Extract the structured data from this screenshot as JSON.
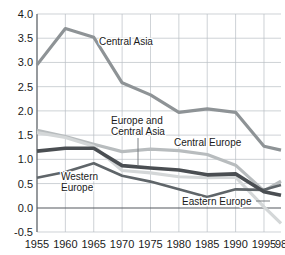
{
  "chart_data": {
    "type": "line",
    "title": "",
    "xlabel": "",
    "ylabel": "",
    "xlim": [
      1955,
      1998
    ],
    "ylim": [
      -0.5,
      4.0
    ],
    "grid": true,
    "legend_position": "inline-annotations",
    "x": [
      1955,
      1960,
      1965,
      1970,
      1975,
      1980,
      1985,
      1990,
      1995,
      1998
    ],
    "xtick_labels": [
      "1955",
      "1960",
      "1965",
      "1970",
      "1975",
      "1980",
      "1985",
      "1990",
      "1995",
      "98"
    ],
    "ytick_labels": [
      "4.0",
      "3.5",
      "3.0",
      "2.5",
      "2.0",
      "1.5",
      "1.0",
      "0.5",
      "0.0",
      "-0.5"
    ],
    "ytick_values": [
      4.0,
      3.5,
      3.0,
      2.5,
      2.0,
      1.5,
      1.0,
      0.5,
      0.0,
      -0.5
    ],
    "series": [
      {
        "name": "Central Asia",
        "color": "#8e9396",
        "width": 3.2,
        "values": [
          2.95,
          3.7,
          3.52,
          2.58,
          2.33,
          1.97,
          2.04,
          1.97,
          1.27,
          1.19
        ]
      },
      {
        "name": "Central Europe",
        "color": "#b8bcbe",
        "width": 3.2,
        "values": [
          1.6,
          1.47,
          1.31,
          1.16,
          1.21,
          1.18,
          1.1,
          0.88,
          0.35,
          0.55
        ]
      },
      {
        "name": "Europe and Central Asia",
        "color": "#d4d7d8",
        "width": 3.2,
        "values": [
          1.55,
          1.45,
          1.27,
          0.77,
          0.72,
          0.64,
          0.62,
          0.63,
          0.02,
          -0.32
        ]
      },
      {
        "name": "Eastern Europe",
        "color": "#4a4e52",
        "width": 3.6,
        "values": [
          1.17,
          1.23,
          1.23,
          0.87,
          0.82,
          0.78,
          0.68,
          0.7,
          0.33,
          0.26
        ]
      },
      {
        "name": "Western Europe",
        "color": "#5f6569",
        "width": 2.6,
        "values": [
          0.62,
          0.74,
          0.92,
          0.66,
          0.54,
          0.38,
          0.22,
          0.38,
          0.37,
          0.47
        ]
      }
    ],
    "annotations": [
      {
        "name": "central-asia",
        "text": "Central Asia",
        "lines": [
          "Central Asia"
        ]
      },
      {
        "name": "europe-and-central-asia",
        "text": "Europe and Central Asia",
        "lines": [
          "Europe and",
          "Central Asia"
        ]
      },
      {
        "name": "central-europe",
        "text": "Central Europe",
        "lines": [
          "Central Europe"
        ]
      },
      {
        "name": "western-europe",
        "text": "Western Europe",
        "lines": [
          "Western",
          "Europe"
        ]
      },
      {
        "name": "eastern-europe",
        "text": "Eastern Europe",
        "lines": [
          "Eastern Europe"
        ]
      }
    ]
  }
}
